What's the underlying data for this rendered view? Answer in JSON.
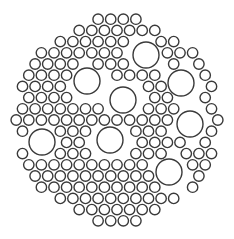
{
  "diagram": {
    "title": "",
    "width": 234,
    "height": 239,
    "background": "#ffffff",
    "stroke_color": "#3a3a3a",
    "stroke_width": 1.4,
    "boundary": {
      "cx": 117,
      "cy": 120,
      "r": 108
    },
    "large_circles": {
      "r": 13,
      "items": [
        {
          "cx": 146,
          "cy": 55
        },
        {
          "cx": 87,
          "cy": 81
        },
        {
          "cx": 181,
          "cy": 83
        },
        {
          "cx": 123,
          "cy": 100
        },
        {
          "cx": 42,
          "cy": 142
        },
        {
          "cx": 110,
          "cy": 140
        },
        {
          "cx": 190,
          "cy": 124
        },
        {
          "cx": 169,
          "cy": 172
        }
      ]
    },
    "small_circles": {
      "r": 5.2,
      "grid_spacing_x": 12.6,
      "grid_spacing_y": 11.2,
      "clearance": 5.5
    }
  }
}
